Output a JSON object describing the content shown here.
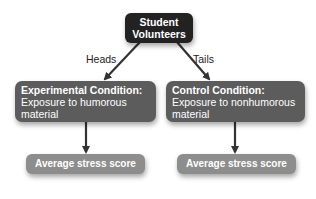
{
  "diagram": {
    "root": {
      "label_line1": "Student",
      "label_line2": "Volunteers"
    },
    "edges": {
      "left_label": "Heads",
      "right_label": "Tails"
    },
    "conditions": [
      {
        "title": "Experimental Condition:",
        "body_line1": "Exposure to humorous",
        "body_line2": "material"
      },
      {
        "title": "Control Condition:",
        "body_line1": "Exposure to nonhumorous",
        "body_line2": "material"
      }
    ],
    "outcomes": [
      {
        "label": "Average stress score"
      },
      {
        "label": "Average stress score"
      }
    ],
    "colors": {
      "root_fill": "#222222",
      "condition_fill": "#5c5c5c",
      "outcome_fill": "#8d8d8d",
      "arrow": "#333333",
      "text": "#ffffff"
    }
  }
}
